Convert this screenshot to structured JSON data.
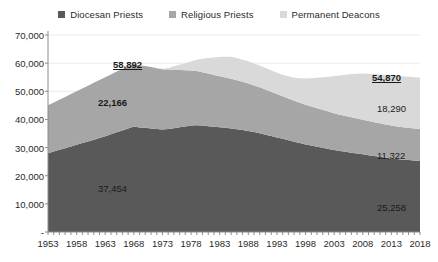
{
  "legend": {
    "position": "top-center",
    "items": [
      {
        "label": "Diocesan Priests",
        "color": "#595959",
        "icon": "square-marker-icon"
      },
      {
        "label": "Religious Priests",
        "color": "#a6a6a6",
        "icon": "square-marker-icon"
      },
      {
        "label": "Permanent Deacons",
        "color": "#d9d9d9",
        "icon": "square-marker-icon"
      }
    ]
  },
  "callouts": [
    {
      "name": "total-1968-label",
      "text": "58,892",
      "style": "bold",
      "x": 113,
      "y": 59
    },
    {
      "name": "religious-priests-1968-label",
      "text": "22,166",
      "style": "semi",
      "x": 98,
      "y": 97
    },
    {
      "name": "diocesan-priests-1968-label",
      "text": "37,454",
      "style": "plain",
      "x": 98,
      "y": 183
    },
    {
      "name": "total-2018-label",
      "text": "54,870",
      "style": "bold",
      "x": 372,
      "y": 72
    },
    {
      "name": "permanent-deacons-2018-label",
      "text": "18,290",
      "style": "plain",
      "x": 377,
      "y": 103
    },
    {
      "name": "religious-priests-2018-label",
      "text": "11,322",
      "style": "plain",
      "x": 377,
      "y": 150
    },
    {
      "name": "diocesan-priests-2018-label",
      "text": "25,258",
      "style": "plain",
      "x": 377,
      "y": 202
    }
  ],
  "chart_data": {
    "type": "area",
    "stacked": true,
    "title": "",
    "xlabel": "",
    "ylabel": "",
    "grid": true,
    "xlim": [
      1953,
      2018
    ],
    "ylim": [
      0,
      70000
    ],
    "ytick_labels": [
      "70,000",
      "60,000",
      "50,000",
      "40,000",
      "30,000",
      "20,000",
      "10,000",
      "-"
    ],
    "ytick_values": [
      70000,
      60000,
      50000,
      40000,
      30000,
      20000,
      10000,
      0
    ],
    "xtick_labels": [
      "1953",
      "1958",
      "1963",
      "1968",
      "1973",
      "1978",
      "1983",
      "1988",
      "1993",
      "1998",
      "2003",
      "2008",
      "2013",
      "2018"
    ],
    "xtick_values": [
      1953,
      1958,
      1963,
      1968,
      1973,
      1978,
      1983,
      1988,
      1993,
      1998,
      2003,
      2008,
      2013,
      2018
    ],
    "x": [
      1953,
      1954,
      1955,
      1956,
      1957,
      1958,
      1959,
      1960,
      1961,
      1962,
      1963,
      1964,
      1965,
      1966,
      1967,
      1968,
      1969,
      1970,
      1971,
      1972,
      1973,
      1974,
      1975,
      1976,
      1977,
      1978,
      1979,
      1980,
      1981,
      1982,
      1983,
      1984,
      1985,
      1986,
      1987,
      1988,
      1989,
      1990,
      1991,
      1992,
      1993,
      1994,
      1995,
      1996,
      1997,
      1998,
      1999,
      2000,
      2001,
      2002,
      2003,
      2004,
      2005,
      2006,
      2007,
      2008,
      2009,
      2010,
      2011,
      2012,
      2013,
      2014,
      2015,
      2016,
      2017,
      2018
    ],
    "series": [
      {
        "name": "Diocesan Priests",
        "color": "#595959",
        "values": [
          28000,
          28600,
          29200,
          29800,
          30400,
          31000,
          31600,
          32200,
          32800,
          33400,
          34000,
          34700,
          35400,
          36100,
          36800,
          37454,
          37100,
          37000,
          36800,
          36600,
          36400,
          36600,
          36900,
          37200,
          37500,
          37800,
          37900,
          37800,
          37600,
          37400,
          37200,
          37000,
          36800,
          36500,
          36200,
          35900,
          35500,
          35100,
          34600,
          34100,
          33600,
          33100,
          32600,
          32100,
          31600,
          31100,
          30700,
          30300,
          29900,
          29500,
          29100,
          28800,
          28500,
          28200,
          27900,
          27600,
          27300,
          27000,
          26700,
          26400,
          26100,
          25900,
          25700,
          25550,
          25400,
          25258
        ]
      },
      {
        "name": "Religious Priests",
        "color": "#a6a6a6",
        "values": [
          17000,
          17400,
          17800,
          18200,
          18600,
          19000,
          19400,
          19800,
          20200,
          20600,
          21000,
          21300,
          21600,
          21800,
          22000,
          22166,
          22100,
          22000,
          21800,
          21600,
          21400,
          21100,
          20800,
          20400,
          20000,
          19600,
          19300,
          19000,
          18700,
          18400,
          18150,
          17900,
          17650,
          17400,
          17150,
          16900,
          16600,
          16300,
          16000,
          15700,
          15400,
          15100,
          14800,
          14550,
          14300,
          14100,
          13900,
          13700,
          13500,
          13300,
          13100,
          12900,
          12750,
          12600,
          12450,
          12300,
          12150,
          12000,
          11900,
          11800,
          11700,
          11600,
          11520,
          11450,
          11380,
          11322
        ]
      },
      {
        "name": "Permanent Deacons",
        "color": "#d9d9d9",
        "values": [
          0,
          0,
          0,
          0,
          0,
          0,
          0,
          0,
          0,
          0,
          0,
          0,
          0,
          0,
          0,
          0,
          0,
          0,
          0,
          50,
          200,
          600,
          1200,
          1800,
          2500,
          3200,
          4000,
          4800,
          5500,
          6200,
          6900,
          7400,
          7800,
          7950,
          7900,
          7850,
          7800,
          7750,
          7700,
          7650,
          7600,
          7700,
          7900,
          8200,
          8700,
          9300,
          10000,
          10800,
          11600,
          12400,
          13200,
          13900,
          14600,
          15300,
          15900,
          16400,
          16800,
          17100,
          17400,
          17600,
          17800,
          17950,
          18080,
          18180,
          18240,
          18290
        ]
      }
    ],
    "totals_highlight": [
      {
        "year": 1968,
        "value": 58892
      },
      {
        "year": 2018,
        "value": 54870
      }
    ]
  },
  "geometry": {
    "plot_left": 48,
    "plot_right": 420,
    "plot_top": 35,
    "plot_bottom": 232
  }
}
